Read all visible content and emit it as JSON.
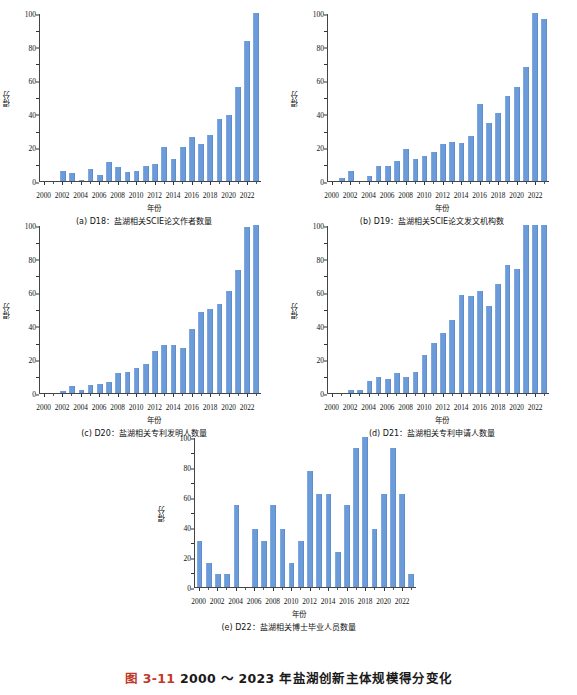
{
  "page": {
    "top_cropped_text": "",
    "figure_caption_number": "图 3-11",
    "figure_caption_text": "2000 ～ 2023 年盐湖创新主体规模得分变化",
    "accent_color": "#c0392b",
    "bar_color": "#6b9bd8",
    "axis_color": "#444444"
  },
  "common": {
    "xlabel": "年份",
    "ylabel": "得分",
    "yticks": [
      0,
      20,
      40,
      60,
      80,
      100
    ],
    "ylim": [
      0,
      100
    ],
    "xtick_labels": [
      "2000",
      "2002",
      "2004",
      "2006",
      "2008",
      "2010",
      "2012",
      "2014",
      "2016",
      "2018",
      "2020",
      "2022"
    ],
    "years": [
      2000,
      2001,
      2002,
      2003,
      2004,
      2005,
      2006,
      2007,
      2008,
      2009,
      2010,
      2011,
      2012,
      2013,
      2014,
      2015,
      2016,
      2017,
      2018,
      2019,
      2020,
      2021,
      2022,
      2023
    ]
  },
  "chart_data": [
    {
      "id": "a",
      "panel_label": "(a)",
      "indicator": "D18",
      "caption": "(a) D18：盐湖相关SCIE论文作者数量",
      "type": "bar",
      "title": "",
      "xlabel": "年份",
      "ylabel": "得分",
      "ylim": [
        0,
        100
      ],
      "grid": false,
      "legend": "none",
      "categories": [
        2000,
        2001,
        2002,
        2003,
        2004,
        2005,
        2006,
        2007,
        2008,
        2009,
        2010,
        2011,
        2012,
        2013,
        2014,
        2015,
        2016,
        2017,
        2018,
        2019,
        2020,
        2021,
        2022,
        2023
      ],
      "values": [
        0,
        0,
        6.0,
        5.0,
        0.8,
        7.0,
        3.7,
        11.4,
        8.2,
        5.2,
        6.0,
        9.0,
        10.0,
        20.3,
        13.0,
        20.0,
        26.4,
        22.3,
        27.4,
        37.0,
        39.5,
        56.0,
        83.6,
        100.0
      ]
    },
    {
      "id": "b",
      "panel_label": "(b)",
      "indicator": "D19",
      "caption": "(b) D19：盐湖相关SCIE论文发文机构数",
      "type": "bar",
      "title": "",
      "xlabel": "年份",
      "ylabel": "得分",
      "ylim": [
        0,
        100
      ],
      "grid": false,
      "legend": "none",
      "categories": [
        2000,
        2001,
        2002,
        2003,
        2004,
        2005,
        2006,
        2007,
        2008,
        2009,
        2010,
        2011,
        2012,
        2013,
        2014,
        2015,
        2016,
        2017,
        2018,
        2019,
        2020,
        2021,
        2022,
        2023
      ],
      "values": [
        0,
        1.8,
        6.2,
        0,
        3.0,
        9.0,
        9.0,
        11.7,
        19.1,
        13.0,
        14.8,
        17.5,
        22.0,
        23.3,
        22.8,
        26.8,
        45.8,
        34.8,
        40.4,
        50.6,
        55.8,
        67.8,
        100.0,
        96.5
      ]
    },
    {
      "id": "c",
      "panel_label": "(c)",
      "indicator": "D20",
      "caption": "(c) D20：盐湖相关专利发明人数量",
      "type": "bar",
      "title": "",
      "xlabel": "年份",
      "ylabel": "得分",
      "ylim": [
        0,
        100
      ],
      "grid": false,
      "legend": "none",
      "categories": [
        2000,
        2001,
        2002,
        2003,
        2004,
        2005,
        2006,
        2007,
        2008,
        2009,
        2010,
        2011,
        2012,
        2013,
        2014,
        2015,
        2016,
        2017,
        2018,
        2019,
        2020,
        2021,
        2022,
        2023
      ],
      "values": [
        0,
        0,
        1.0,
        4.0,
        2.0,
        5.0,
        5.2,
        6.8,
        11.7,
        12.7,
        15.0,
        17.0,
        25.2,
        28.8,
        28.8,
        27.0,
        38.0,
        48.0,
        50.3,
        53.0,
        61.0,
        73.0,
        98.8,
        100.0
      ]
    },
    {
      "id": "d",
      "panel_label": "(d)",
      "indicator": "D21",
      "caption": "(d) D21：盐湖相关专利申请人数量",
      "type": "bar",
      "title": "",
      "xlabel": "年份",
      "ylabel": "得分",
      "ylim": [
        0,
        100
      ],
      "grid": false,
      "legend": "none",
      "categories": [
        2000,
        2001,
        2002,
        2003,
        2004,
        2005,
        2006,
        2007,
        2008,
        2009,
        2010,
        2011,
        2012,
        2013,
        2014,
        2015,
        2016,
        2017,
        2018,
        2019,
        2020,
        2021,
        2022,
        2023
      ],
      "values": [
        0,
        0,
        2.0,
        1.6,
        7.4,
        9.3,
        8.6,
        12.1,
        9.4,
        12.7,
        22.4,
        29.5,
        36.0,
        43.2,
        58.5,
        58.0,
        60.6,
        51.6,
        65.0,
        76.2,
        74.0,
        100.0,
        100.0,
        100.0
      ]
    },
    {
      "id": "e",
      "panel_label": "(e)",
      "indicator": "D22",
      "caption": "(e) D22：盐湖相关博士毕业人员数量",
      "type": "bar",
      "title": "",
      "xlabel": "年份",
      "ylabel": "得分",
      "ylim": [
        0,
        100
      ],
      "grid": false,
      "legend": "none",
      "categories": [
        2000,
        2001,
        2002,
        2003,
        2004,
        2005,
        2006,
        2007,
        2008,
        2009,
        2010,
        2011,
        2012,
        2013,
        2014,
        2015,
        2016,
        2017,
        2018,
        2019,
        2020,
        2021,
        2022,
        2023
      ],
      "values": [
        31.0,
        15.8,
        8.5,
        8.5,
        54.5,
        0,
        38.8,
        31.0,
        54.5,
        38.8,
        15.8,
        31.0,
        77.3,
        62.0,
        62.0,
        23.3,
        54.5,
        92.5,
        100.0,
        38.8,
        62.0,
        92.5,
        62.0,
        8.5
      ]
    }
  ]
}
